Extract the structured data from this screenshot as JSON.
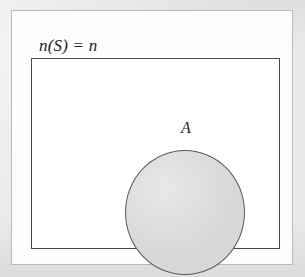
{
  "figure": {
    "type": "set-venn-diagram",
    "caption_present": false,
    "background_color": "#e9e9e9",
    "panel_color": "#fdfdfd",
    "panel_border_color": "#b9b9b9"
  },
  "universal_set": {
    "name": "S",
    "label": "n(S)  =  n",
    "shape": "rectangle",
    "fill_color": "#ffffff",
    "border_color": "#4a4a4a"
  },
  "subset": {
    "name": "A",
    "name_label": "A",
    "count_label": "n(A)  =  k",
    "shape": "circle",
    "fill_color": "#d8d8d8",
    "border_color": "#5a5a5a"
  }
}
